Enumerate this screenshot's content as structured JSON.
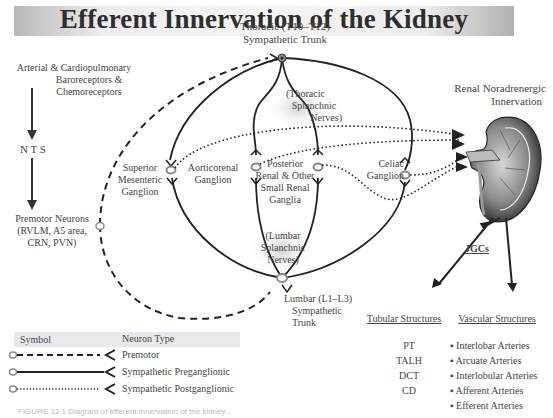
{
  "title": "Efferent Innervation of the Kidney",
  "labels": {
    "baroreceptors": [
      "Arterial & Cardiopulmonary",
      "Baroreceptors &",
      "Chemoreceptors"
    ],
    "nts": "N T S",
    "premotor": [
      "Premotor Neurons",
      "(RVLM, A5 area,",
      "CRN, PVN)"
    ],
    "thoracic_trunk": [
      "Thoracic (T10–T12)",
      "Sympathetic Trunk"
    ],
    "thoracic_splanchnic": [
      "(Thoracic",
      "Splanchnic",
      "Nerves)"
    ],
    "superior_mesenteric": [
      "Superior",
      "Mesenteric",
      "Ganglion"
    ],
    "aorticorenal": [
      "Aorticorenal",
      "Ganglion"
    ],
    "posterior_renal": [
      "Posterior",
      "Renal & Other",
      "Small Renal",
      "Ganglia"
    ],
    "celiac": [
      "Celiac",
      "Ganglion"
    ],
    "lumbar_splanchnic": [
      "(Lumbar",
      "Splanchnic",
      "Nerves)"
    ],
    "lumbar_trunk": [
      "Lumbar (L1–L3)",
      "Sympathetic",
      "Trunk"
    ],
    "renal_innervation": [
      "Renal Noradrenergic",
      "Innervation"
    ],
    "jgcs": "JGCs"
  },
  "targets": {
    "tubular_header": "Tubular Structures",
    "vascular_header": "Vascular Structures",
    "tubular": [
      "PT",
      "TALH",
      "DCT",
      "CD"
    ],
    "vascular": [
      "Interlobar Arteries",
      "Arcuate Arteries",
      "Interlobular Arteries",
      "Afferent Arteries",
      "Efferent Arteries"
    ],
    "bullet": "▪"
  },
  "legend": {
    "symbol_header": "Symbol",
    "type_header": "Neuron Type",
    "items": [
      {
        "style": "dashed",
        "label": "Premotor"
      },
      {
        "style": "solid",
        "label": "Sympathetic Preganglionic"
      },
      {
        "style": "dotted",
        "label": "Sympathetic Postganglionic"
      }
    ]
  },
  "caption": "FIGURE 12.1   Diagram of efferent innervation of the kidney..."
}
